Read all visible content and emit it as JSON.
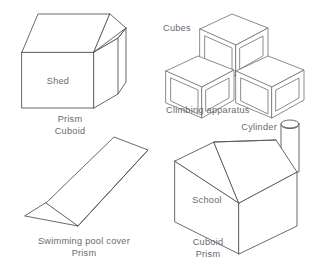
{
  "page": {
    "background_color": "#ffffff",
    "stroke_color": "#58585c",
    "text_color": "#6a6a6e"
  },
  "figures": [
    {
      "id": "shed",
      "name": "shed",
      "inner_label": "Shed",
      "captions": [
        "Prism",
        "Cuboid"
      ],
      "shape_kind": "triangular-prism-roof-cuboid"
    },
    {
      "id": "climbing-apparatus",
      "name": "climbing-apparatus",
      "top_label": "Cubes",
      "captions": [
        "Climbing apparatus"
      ],
      "shape_kind": "three-cubes",
      "cube_count": 3
    },
    {
      "id": "swimming-pool-cover",
      "name": "swimming-pool-cover",
      "captions": [
        "Swimming pool cover",
        "Prism"
      ],
      "shape_kind": "triangular-prism"
    },
    {
      "id": "school",
      "name": "school",
      "inner_label": "School",
      "top_label": "Cylinder",
      "captions": [
        "Cuboid",
        "Prism"
      ],
      "shape_kind": "house-with-chimney"
    }
  ],
  "labels": {
    "shed_inner": "Shed",
    "shed_caption_1": "Prism",
    "shed_caption_2": "Cuboid",
    "cubes_label": "Cubes",
    "climbing_caption": "Climbing apparatus",
    "pool_caption_1": "Swimming pool cover",
    "pool_caption_2": "Prism",
    "cylinder_label": "Cylinder",
    "school_inner": "School",
    "school_caption_1": "Cuboid",
    "school_caption_2": "Prism"
  }
}
